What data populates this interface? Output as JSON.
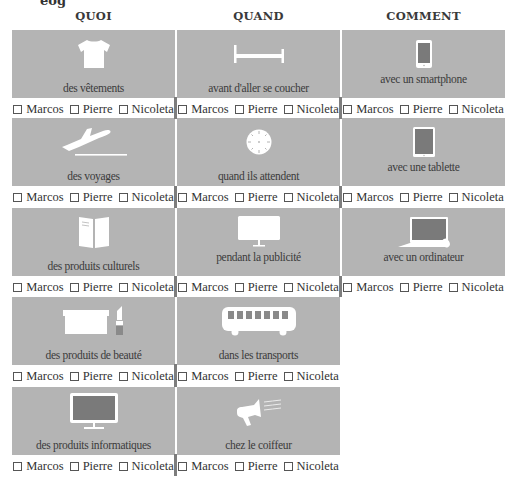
{
  "page": {
    "cut_heading": "eog"
  },
  "columns": [
    {
      "heading": "QUOI",
      "items": [
        {
          "icon": "tshirt-icon",
          "label": "des vêtements"
        },
        {
          "icon": "airplane-takeoff-icon",
          "label": "des voyages"
        },
        {
          "icon": "book-icon",
          "label": "des produits culturels"
        },
        {
          "icon": "box-lipstick-icon",
          "label": "des produits de beauté"
        },
        {
          "icon": "computer-monitor-icon",
          "label": "des produits informatiques"
        }
      ]
    },
    {
      "heading": "QUAND",
      "items": [
        {
          "icon": "bed-icon",
          "label": "avant d'aller se coucher"
        },
        {
          "icon": "clock-icon",
          "label": "quand ils attendent"
        },
        {
          "icon": "tv-screen-icon",
          "label": "pendant la publicité"
        },
        {
          "icon": "bus-icon",
          "label": "dans les transports"
        },
        {
          "icon": "megaphone-icon",
          "label": "chez le coiffeur"
        }
      ]
    },
    {
      "heading": "COMMENT",
      "items": [
        {
          "icon": "smartphone-icon",
          "label": "avec un smartphone"
        },
        {
          "icon": "tablet-icon",
          "label": "avec une tablette"
        },
        {
          "icon": "laptop-icon",
          "label": "avec un ordinateur"
        }
      ]
    }
  ],
  "names": [
    "Marcos",
    "Pierre",
    "Nicoleta"
  ],
  "colors": {
    "box": "#b4b4b4",
    "icon": "#ffffff",
    "screen": "#7a7a7a",
    "separator": "#7d7d7d"
  }
}
